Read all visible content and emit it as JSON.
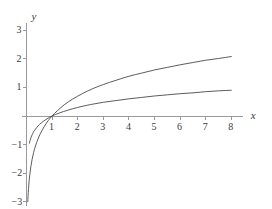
{
  "chart_data": {
    "type": "line",
    "title": "",
    "subtitle": "",
    "xlabel": "x",
    "ylabel": "y",
    "xlim": [
      0,
      8.45
    ],
    "ylim": [
      -3.15,
      3.25
    ],
    "grid": false,
    "legend": false,
    "legend_position": "none",
    "x_ticks": [
      1,
      2,
      3,
      4,
      5,
      6,
      7,
      8
    ],
    "x_tick_labels": [
      "1",
      "2",
      "3",
      "4",
      "5",
      "6",
      "7",
      "8"
    ],
    "y_ticks": [
      -3,
      -2,
      -1,
      1,
      2,
      3
    ],
    "y_tick_labels": [
      "−3",
      "−2",
      "−1",
      "1",
      "2",
      "3"
    ],
    "series": [
      {
        "name": "natural-log-curve",
        "color": "#4a4a4a",
        "x": [
          0.0498,
          0.06,
          0.08,
          0.1,
          0.13,
          0.17,
          0.22,
          0.28,
          0.35,
          0.45,
          0.55,
          0.7,
          0.85,
          1.0,
          1.2,
          1.5,
          1.8,
          2.2,
          2.6,
          3.0,
          3.5,
          4.0,
          4.5,
          5.0,
          5.5,
          6.0,
          6.5,
          7.0,
          7.5,
          8.0
        ],
        "y": [
          -3.0,
          -2.81,
          -2.53,
          -2.3,
          -2.04,
          -1.77,
          -1.51,
          -1.27,
          -1.05,
          -0.8,
          -0.6,
          -0.36,
          -0.16,
          0.0,
          0.18,
          0.41,
          0.59,
          0.79,
          0.96,
          1.1,
          1.25,
          1.39,
          1.5,
          1.61,
          1.7,
          1.79,
          1.87,
          1.95,
          2.01,
          2.08
        ]
      },
      {
        "name": "log10-curve",
        "color": "#4a4a4a",
        "x": [
          0.112,
          0.14,
          0.18,
          0.23,
          0.3,
          0.4,
          0.5,
          0.65,
          0.8,
          1.0,
          1.3,
          1.6,
          2.0,
          2.5,
          3.0,
          3.5,
          4.0,
          4.5,
          5.0,
          5.5,
          6.0,
          6.5,
          7.0,
          7.5,
          8.0
        ],
        "y": [
          -0.95,
          -0.85,
          -0.74,
          -0.64,
          -0.52,
          -0.4,
          -0.3,
          -0.19,
          -0.1,
          0.0,
          0.11,
          0.2,
          0.3,
          0.4,
          0.48,
          0.54,
          0.6,
          0.65,
          0.7,
          0.74,
          0.78,
          0.81,
          0.85,
          0.88,
          0.9
        ]
      }
    ],
    "annotations": [],
    "axis_color": "#9a9a9a",
    "curve_color": "#4a4a4a",
    "background_color": "#ffffff"
  },
  "axes": {
    "y_axis_label": "y",
    "x_axis_label": "x"
  },
  "ticks": {
    "x": [
      "1",
      "2",
      "3",
      "4",
      "5",
      "6",
      "7",
      "8"
    ],
    "y_positive": [
      "3",
      "2",
      "1"
    ],
    "y_negative": [
      "−1",
      "−2",
      "−3"
    ]
  }
}
